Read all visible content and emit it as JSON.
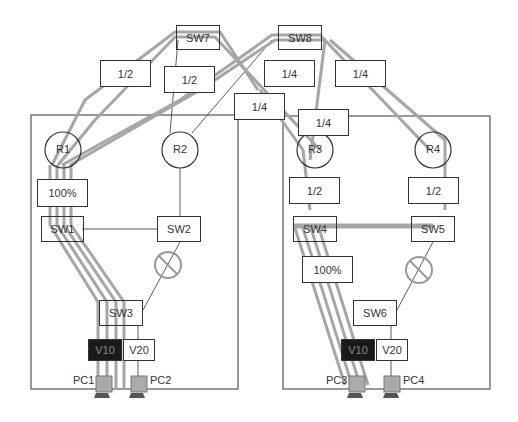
{
  "switches": {
    "sw1": "SW1",
    "sw2": "SW2",
    "sw3": "SW3",
    "sw4": "SW4",
    "sw5": "SW5",
    "sw6": "SW6",
    "sw7": "SW7",
    "sw8": "SW8"
  },
  "routers": {
    "r1": "R1",
    "r2": "R2",
    "r3": "R3",
    "r4": "R4"
  },
  "vlans": {
    "v10_left": "V10",
    "v20_left": "V20",
    "v10_right": "V10",
    "v20_right": "V20"
  },
  "pcs": {
    "pc1": "PC1",
    "pc2": "PC2",
    "pc3": "PC3",
    "pc4": "PC4"
  },
  "load_labels": {
    "sw7_r1_a": "1/2",
    "sw7_r1_b": "1/2",
    "r1_sw1": "100%",
    "sw8_a": "1/4",
    "sw8_b": "1/4",
    "sw7_r3": "1/4",
    "sw8_r3": "1/4",
    "r3_sw4": "1/2",
    "r4_sw5": "1/2",
    "sw4_sw6": "100%"
  },
  "colors": {
    "traffic": "#a6a6a6",
    "line": "#333333",
    "vlan10_bg": "#1a1a1a"
  }
}
